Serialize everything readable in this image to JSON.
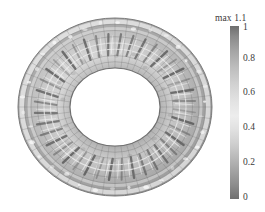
{
  "figure": {
    "background_color": "#ffffff",
    "width": 265,
    "height": 212
  },
  "colorbar": {
    "max_label": "max 1.1",
    "orientation": "vertical",
    "min_value": 0,
    "max_value": 1.1,
    "tick_labels": [
      "1",
      "0.8",
      "0.6",
      "0.4",
      "0.2",
      "0"
    ],
    "tick_values": [
      1,
      0.8,
      0.6,
      0.4,
      0.2,
      0
    ],
    "colormap": "grayscale-dark-light-dark",
    "gradient_stops": [
      "#6e6e6e",
      "#a3a3a3",
      "#d2d2d2",
      "#ededed",
      "#cfcfcf",
      "#a2a2a2",
      "#6f6f6f"
    ],
    "strip": {
      "x": 230,
      "y": 26,
      "width": 9,
      "height": 173
    }
  },
  "chart_data": {
    "type": "heatmap",
    "title": "",
    "subtitle": "",
    "xlabel": "",
    "ylabel": "",
    "grid": true,
    "legend_position": "right",
    "colorbar_label": "max 1.1",
    "colorbar_range": [
      0,
      1.1
    ],
    "colorbar_ticks": [
      0,
      0.2,
      0.4,
      0.6,
      0.8,
      1
    ],
    "geometry": {
      "shape": "annulus",
      "projection": "oblique-3d",
      "center_x": 115,
      "center_y": 107,
      "outer_rx": 97,
      "outer_ry": 89,
      "inner_rx": 45,
      "inner_ry": 39,
      "hole_fill": "#ffffff",
      "circumferential_divisions": 48,
      "radial_divisions": 8,
      "mesh_line_color": "#6a6a6a"
    },
    "annotations": [
      {
        "text": "max 1.1",
        "x": 215,
        "y": 19
      }
    ],
    "field_description": "Scalar field magnitude rendered as grayscale on an annular (torus) finite-element mesh; bright bands near value 0.5-0.7, darker blade-like streaks approaching 1.0 arranged radially in the inner annulus.",
    "values_sampled": {
      "outer_rim": 0.62,
      "mid_annulus_light_band": 0.52,
      "blade_streaks_dark": 0.95,
      "inner_rim": 0.7,
      "min": 0.0,
      "max": 1.1
    }
  }
}
